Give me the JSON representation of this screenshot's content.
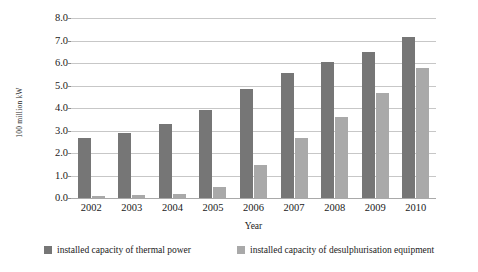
{
  "chart_data": {
    "type": "bar",
    "title": "",
    "subtitle": "",
    "xlabel": "Year",
    "ylabel": "100 million kW",
    "categories": [
      "2002",
      "2003",
      "2004",
      "2005",
      "2006",
      "2007",
      "2008",
      "2009",
      "2010"
    ],
    "series": [
      {
        "name": "installed capacity of thermal power",
        "color": "#767676",
        "values": [
          2.65,
          2.9,
          3.3,
          3.9,
          4.85,
          5.55,
          6.05,
          6.5,
          7.15
        ]
      },
      {
        "name": "installed capacity of desulphurisation equipment",
        "color": "#a9a9a9",
        "values": [
          0.08,
          0.13,
          0.18,
          0.5,
          1.45,
          2.65,
          3.6,
          4.65,
          5.8
        ]
      }
    ],
    "ylim": [
      0.0,
      8.0
    ],
    "ytick_step": 1.0,
    "ytick_labels": [
      "8.0",
      "7.0",
      "6.0",
      "5.0",
      "4.0",
      "3.0",
      "2.0",
      "1.0",
      "0.0"
    ],
    "grid": "horizontal",
    "legend_position": "bottom"
  },
  "legend": {
    "entries": [
      {
        "label": "installed capacity of thermal power",
        "swatch": "series-a-swatch"
      },
      {
        "label": "installed capacity of desulphurisation equipment",
        "swatch": "series-b-swatch"
      }
    ]
  },
  "colors": {
    "series_a": "#767676",
    "series_b": "#a9a9a9",
    "gridline": "#c7c7c7",
    "baseline": "#a9a9a9",
    "text": "#1a1a1a",
    "background": "#ffffff"
  }
}
